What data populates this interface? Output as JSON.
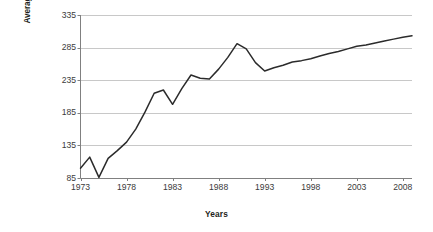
{
  "chart_data": {
    "type": "line",
    "title": "",
    "xlabel": "Years",
    "ylabel": "Average price of grapes per kg (100=1973)",
    "ylabel_line1": "Average price of grapes per kg",
    "ylabel_line2": "(100=1973)",
    "xlim": [
      1973,
      2009
    ],
    "ylim": [
      85,
      335
    ],
    "yticks": [
      335,
      285,
      235,
      185,
      135,
      85
    ],
    "ytick_labels": [
      "335",
      "285",
      "235",
      "185",
      "135",
      "85"
    ],
    "xticks": [
      1973,
      1978,
      1983,
      1988,
      1993,
      1998,
      2003,
      2008
    ],
    "xtick_labels": [
      "1973",
      "1978",
      "1983",
      "1988",
      "1993",
      "1998",
      "2003",
      "2008"
    ],
    "grid": "horizontal",
    "legend": "none",
    "line_color": "#2b2b2b",
    "grid_color": "#c8c8c8",
    "axis_color": "#808080",
    "series": [
      {
        "name": "Average price of grapes per kg",
        "x": [
          1973,
          1974,
          1975,
          1976,
          1977,
          1978,
          1979,
          1980,
          1981,
          1982,
          1983,
          1984,
          1985,
          1986,
          1987,
          1988,
          1989,
          1990,
          1991,
          1992,
          1993,
          1994,
          1995,
          1996,
          1997,
          1998,
          1999,
          2000,
          2001,
          2002,
          2003,
          2004,
          2005,
          2006,
          2007,
          2008,
          2009
        ],
        "values": [
          100,
          117,
          86,
          115,
          127,
          140,
          160,
          186,
          215,
          220,
          198,
          222,
          243,
          238,
          237,
          252,
          270,
          291,
          283,
          262,
          249,
          254,
          258,
          263,
          265,
          268,
          272,
          276,
          279,
          283,
          287,
          289,
          292,
          295,
          298,
          301,
          303
        ]
      }
    ]
  }
}
